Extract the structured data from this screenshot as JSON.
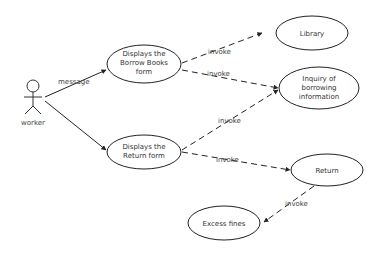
{
  "diagram": {
    "type": "use-case",
    "actor": {
      "label": "worker"
    },
    "use_cases": [
      {
        "id": "borrow",
        "lines": [
          "Displays the",
          "Borrow Books",
          "form"
        ]
      },
      {
        "id": "return_form",
        "lines": [
          "Displays the",
          "Return form"
        ]
      },
      {
        "id": "library",
        "lines": [
          "Library"
        ]
      },
      {
        "id": "inquiry",
        "lines": [
          "Inquiry of",
          "borrowing",
          "information"
        ]
      },
      {
        "id": "return",
        "lines": [
          "Return"
        ]
      },
      {
        "id": "fines",
        "lines": [
          "Excess fines"
        ]
      }
    ],
    "edges": [
      {
        "from": "worker",
        "to": "borrow",
        "label": "message"
      },
      {
        "from": "worker",
        "to": "return_form",
        "label": ""
      },
      {
        "from": "borrow",
        "to": "library",
        "label": "invoke"
      },
      {
        "from": "borrow",
        "to": "inquiry",
        "label": "invoke"
      },
      {
        "from": "return_form",
        "to": "inquiry",
        "label": "invoke"
      },
      {
        "from": "return_form",
        "to": "return",
        "label": "invoke"
      },
      {
        "from": "return",
        "to": "fines",
        "label": "invoke"
      }
    ]
  }
}
